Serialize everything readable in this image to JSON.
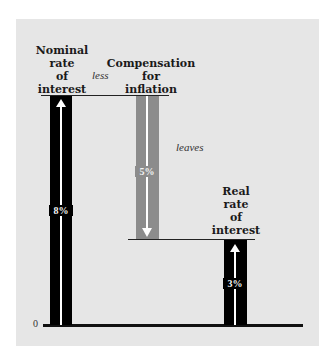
{
  "diagram": {
    "labels": {
      "nominal": "Nominal\nrate\nof\ninterest",
      "compensation": "Compensation\nfor\ninflation",
      "real": "Real\nrate\nof\ninterest",
      "less": "less",
      "leaves": "leaves",
      "zero": "0"
    },
    "values": {
      "nominal": "8%",
      "compensation": "5%",
      "real": "3%"
    },
    "colors": {
      "panel": "#e6e6e6",
      "nominal_bar": "#000000",
      "compensation_bar": "#8c8c8c",
      "real_bar": "#000000",
      "arrow": "#ffffff"
    }
  }
}
